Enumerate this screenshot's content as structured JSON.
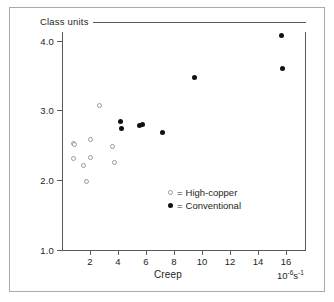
{
  "figure": {
    "class_units_label": "Class units"
  },
  "axes": {
    "y_title": "Marginal fracture",
    "x_title": "Creep",
    "x_units_base": "10",
    "x_units_exp1": "-6",
    "x_units_mid": "s",
    "x_units_exp2": "-1",
    "y_ticks": [
      "4.0",
      "3.0",
      "2.0",
      "1.0"
    ],
    "x_ticks": [
      "2",
      "4",
      "6",
      "8",
      "10",
      "12",
      "14",
      "16"
    ]
  },
  "legend": {
    "equals": "=",
    "items": [
      {
        "marker": "open-circle",
        "label": "High-copper"
      },
      {
        "marker": "filled-circle",
        "label": "Conventional"
      }
    ]
  },
  "chart_data": {
    "type": "scatter",
    "title": "Class units",
    "xlabel": "Creep",
    "ylabel": "Marginal fracture",
    "x_units": "10^-6 s^-1",
    "xlim": [
      0,
      17
    ],
    "ylim": [
      1.0,
      4.2
    ],
    "xticks": [
      2,
      4,
      6,
      8,
      10,
      12,
      14,
      16
    ],
    "yticks": [
      1.0,
      2.0,
      3.0,
      4.0
    ],
    "grid": false,
    "legend_position": "inside-center-right",
    "series": [
      {
        "name": "High-copper",
        "marker": "open-circle",
        "color": "#9a9a9a",
        "points": [
          [
            0.8,
            2.53
          ],
          [
            0.88,
            2.51
          ],
          [
            0.8,
            2.31
          ],
          [
            1.55,
            2.22
          ],
          [
            1.75,
            1.98
          ],
          [
            2.05,
            2.33
          ],
          [
            2.05,
            2.58
          ],
          [
            2.7,
            3.08
          ],
          [
            3.6,
            2.48
          ],
          [
            3.75,
            2.25
          ]
        ]
      },
      {
        "name": "Conventional",
        "marker": "filled-circle",
        "color": "#111111",
        "points": [
          [
            4.15,
            2.84
          ],
          [
            4.25,
            2.75
          ],
          [
            5.55,
            2.79
          ],
          [
            5.72,
            2.8
          ],
          [
            7.2,
            2.68
          ],
          [
            9.45,
            3.48
          ],
          [
            15.7,
            4.08
          ],
          [
            15.78,
            3.61
          ]
        ]
      }
    ]
  }
}
